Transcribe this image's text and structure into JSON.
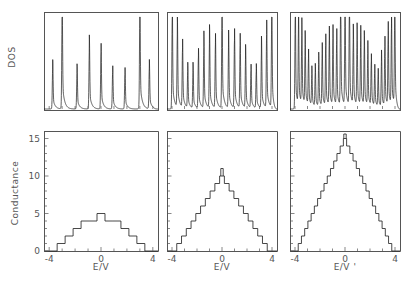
{
  "figure": {
    "ylabel_top": "DOS",
    "ylabel_bottom": "Conductance",
    "xlabels": [
      "E/V",
      "E/V",
      "E/V '"
    ],
    "xticklabels": [
      "-4",
      "0",
      "4"
    ],
    "yticklabels_bottom": [
      "0",
      "5",
      "10",
      "15"
    ],
    "line_color": "#1a1a1a",
    "frame_color": "#555555",
    "background": "#ffffff"
  },
  "chart_data": [
    {
      "type": "line",
      "panel": "dos-left",
      "title": "",
      "xlabel": "E/V",
      "ylabel": "DOS",
      "xlim": [
        -4.4,
        4.4
      ],
      "ylim": [
        0,
        1.05
      ],
      "grid": false,
      "xticks": [
        -4,
        -3,
        -2,
        -1,
        0,
        1,
        2,
        3,
        4
      ],
      "peak_count": 9,
      "peak_positions": [
        -3.73,
        -3.0,
        -1.85,
        -0.9,
        0.0,
        0.9,
        1.85,
        3.0,
        3.73
      ],
      "peak_heights": [
        0.42,
        1.0,
        0.38,
        0.62,
        0.58,
        0.38,
        0.36,
        1.0,
        0.42
      ],
      "description": "Van Hove singularities, 9 spikes, tallest at +/-3.0"
    },
    {
      "type": "line",
      "panel": "dos-middle",
      "title": "",
      "xlabel": "E/V",
      "ylabel": "DOS",
      "xlim": [
        -4.4,
        4.4
      ],
      "ylim": [
        0,
        1.05
      ],
      "grid": false,
      "xticks": [
        -4,
        -3,
        -2,
        -1,
        0,
        1,
        2,
        3,
        4
      ],
      "peak_count": 19,
      "peak_positions": [
        -3.95,
        -3.62,
        -3.3,
        -2.95,
        -2.6,
        -2.2,
        -1.8,
        -1.35,
        -0.9,
        -0.45,
        0.0,
        0.45,
        0.9,
        1.35,
        1.8,
        2.2,
        2.6,
        2.95,
        3.3,
        3.62,
        3.95
      ],
      "peak_heights": [
        0.9,
        0.42,
        0.46,
        0.5,
        0.54,
        0.62,
        0.7,
        0.52,
        0.55,
        0.58,
        1.0,
        0.58,
        0.55,
        0.52,
        0.7,
        0.62,
        0.54,
        0.5,
        0.46,
        0.42,
        0.9
      ],
      "description": "19 sharp peaks, tallest central spike at E=0"
    },
    {
      "type": "line",
      "panel": "dos-right",
      "title": "",
      "xlabel": "E/V '",
      "ylabel": "DOS",
      "xlim": [
        -4.4,
        4.4
      ],
      "ylim": [
        0,
        1.05
      ],
      "grid": false,
      "xticks": [
        -4,
        -3,
        -2,
        -1,
        0,
        1,
        2,
        3,
        4
      ],
      "peak_count": 29,
      "description": "29 densely packed peaks, tallest cluster near E=0 and at band edges"
    },
    {
      "type": "line",
      "panel": "conductance-left",
      "title": "",
      "xlabel": "E/V",
      "ylabel": "Conductance",
      "xlim": [
        -4.4,
        4.4
      ],
      "ylim": [
        0,
        16
      ],
      "grid": false,
      "xticks": [
        -4,
        0,
        4
      ],
      "yticks": [
        0,
        5,
        10,
        15
      ],
      "step_x": [
        -4.0,
        -3.45,
        -2.9,
        -2.3,
        -1.6,
        -0.8,
        0.0,
        0.8,
        1.6,
        2.3,
        2.9,
        3.45,
        4.0
      ],
      "step_values": [
        0,
        1,
        2,
        3,
        4,
        4,
        5,
        4,
        4,
        3,
        2,
        1,
        0
      ],
      "max_value": 5,
      "description": "Quantized conductance staircase peaking at 5"
    },
    {
      "type": "line",
      "panel": "conductance-middle",
      "title": "",
      "xlabel": "E/V",
      "ylabel": "Conductance",
      "xlim": [
        -4.4,
        4.4
      ],
      "ylim": [
        0,
        16
      ],
      "grid": false,
      "xticks": [
        -4,
        0,
        4
      ],
      "yticks": [
        0,
        5,
        10,
        15
      ],
      "step_values": [
        0,
        1,
        2,
        3,
        4,
        5,
        6,
        7,
        8,
        9,
        10,
        9,
        8,
        7,
        6,
        5,
        4,
        3,
        2,
        1,
        0
      ],
      "max_value": 10,
      "spike_value": 11,
      "description": "Quantized conductance staircase peaking at 10 with narrow central spike"
    },
    {
      "type": "line",
      "panel": "conductance-right",
      "title": "",
      "xlabel": "E/V '",
      "ylabel": "Conductance",
      "xlim": [
        -4.4,
        4.4
      ],
      "ylim": [
        0,
        16
      ],
      "grid": false,
      "xticks": [
        -4,
        0,
        4
      ],
      "yticks": [
        0,
        5,
        10,
        15
      ],
      "step_values": [
        0,
        1,
        2,
        3,
        4,
        5,
        6,
        7,
        8,
        9,
        10,
        11,
        12,
        13,
        14,
        15,
        14,
        13,
        12,
        11,
        10,
        9,
        8,
        7,
        6,
        5,
        4,
        3,
        2,
        1,
        0
      ],
      "max_value": 15,
      "description": "Quantized conductance staircase peaking at 15 with narrow central spike"
    }
  ]
}
